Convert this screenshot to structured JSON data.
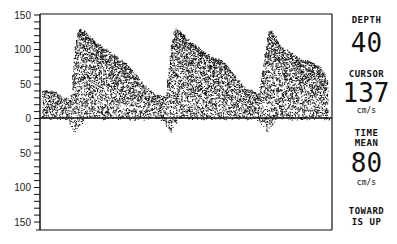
{
  "chart_data": {
    "type": "area",
    "xlabel": "",
    "ylabel": "Velocity (cm/s)",
    "ylim": [
      -150,
      150
    ],
    "y_ticks_labels": [
      "150",
      "100",
      "50",
      "0",
      "50",
      "100",
      "150"
    ],
    "y_tick_values": [
      150,
      100,
      50,
      0,
      -50,
      -100,
      -150
    ],
    "minor_tick_step": 10,
    "grid": false,
    "baseline": 0,
    "series": [
      {
        "name": "spectral envelope (peak velocity)",
        "x_px": [
          42,
          55,
          62,
          70,
          74,
          78,
          85,
          95,
          105,
          115,
          125,
          135,
          145,
          155,
          165,
          170,
          174,
          180,
          190,
          200,
          210,
          220,
          230,
          240,
          250,
          258,
          264,
          268,
          272,
          280,
          290,
          300,
          310,
          320,
          328
        ],
        "values": [
          40,
          38,
          30,
          28,
          100,
          130,
          125,
          110,
          100,
          90,
          80,
          65,
          45,
          35,
          30,
          100,
          130,
          125,
          110,
          100,
          90,
          85,
          70,
          50,
          40,
          35,
          90,
          128,
          125,
          105,
          95,
          85,
          82,
          75,
          50
        ]
      }
    ],
    "cycles": 3,
    "peak_systolic_cm_s": 130
  },
  "panel": {
    "depth_label": "DEPTH",
    "depth_value": "40",
    "cursor_label": "CURSOR",
    "cursor_value": "137",
    "cursor_unit": "cm/s",
    "time_label": "TIME",
    "mean_label": "MEAN",
    "mean_value": "80",
    "mean_unit": "cm/s",
    "direction_line1": "TOWARD",
    "direction_line2": "IS UP"
  },
  "colors": {
    "ink": "#111111",
    "background": "#ffffff"
  }
}
